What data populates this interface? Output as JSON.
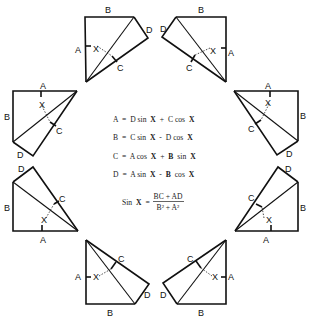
{
  "figure": {
    "labels": {
      "a": "A",
      "b": "B",
      "c": "C",
      "d": "D",
      "x": "X"
    }
  },
  "formulas": {
    "line1": {
      "lhs": "A",
      "eq": "=",
      "t1": "D sin",
      "v1": "X",
      "op": "+",
      "t2": "C cos",
      "v2": "X"
    },
    "line2": {
      "lhs": "B",
      "eq": "=",
      "t1": "C sin",
      "v1": "X",
      "op": "-",
      "t2": "D cos",
      "v2": "X"
    },
    "line3": {
      "lhs": "C",
      "eq": "=",
      "t1": "A cos",
      "v1": "X",
      "op": "+",
      "t2b": "B",
      "t2": "sin",
      "v2": "X"
    },
    "line4": {
      "lhs": "D",
      "eq": "=",
      "t1": "A sin",
      "v1": "X",
      "op": "-",
      "t2b": "B",
      "t2": "cos",
      "v2": "X"
    },
    "sin_x": {
      "lhs": "Sin",
      "var": "X",
      "eq": "=",
      "numerator": "BC + AD",
      "denominator": "B² + A²"
    }
  }
}
